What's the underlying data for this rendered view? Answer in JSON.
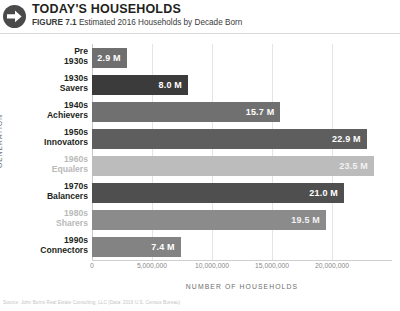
{
  "header": {
    "icon": "arrow-right-circle-icon",
    "title": "TODAY'S HOUSEHOLDS",
    "figure_label": "FIGURE 7.1",
    "subtitle": "Estimated 2016 Households by Decade Born"
  },
  "footer": {
    "source": "Source: John Burns Real Estate Consulting, LLC (Data: 2016 U.S. Census Bureau)"
  },
  "chart_data": {
    "type": "bar",
    "orientation": "horizontal",
    "title": "Estimated 2016 Households by Decade Born",
    "xlabel": "NUMBER OF HOUSEHOLDS",
    "ylabel": "GENERATION",
    "xlim": [
      0,
      25000000
    ],
    "grid": true,
    "legend": "none",
    "xticks": [
      "0",
      "5,000,000",
      "10,000,000",
      "15,000,000",
      "20,000,000"
    ],
    "xtick_values": [
      0,
      5000000,
      10000000,
      15000000,
      20000000
    ],
    "categories": [
      "Pre 1930s",
      "1930s Savers",
      "1940s Achievers",
      "1950s Innovators",
      "1960s Equalers",
      "1970s Balancers",
      "1980s Sharers",
      "1990s Connectors"
    ],
    "values": [
      2900000,
      8000000,
      15700000,
      22900000,
      23500000,
      21000000,
      19500000,
      7400000
    ],
    "bars": [
      {
        "decade": "Pre",
        "generation": "1930s",
        "label": "2.9 M",
        "value": 2900000,
        "color": "#6f6f6f",
        "muted": false
      },
      {
        "decade": "1930s",
        "generation": "Savers",
        "label": "8.0 M",
        "value": 8000000,
        "color": "#3b3b3b",
        "muted": false
      },
      {
        "decade": "1940s",
        "generation": "Achievers",
        "label": "15.7 M",
        "value": 15700000,
        "color": "#707070",
        "muted": false
      },
      {
        "decade": "1950s",
        "generation": "Innovators",
        "label": "22.9 M",
        "value": 22900000,
        "color": "#5e5e5e",
        "muted": false
      },
      {
        "decade": "1960s",
        "generation": "Equalers",
        "label": "23.5 M",
        "value": 23500000,
        "color": "#bcbcbc",
        "muted": true
      },
      {
        "decade": "1970s",
        "generation": "Balancers",
        "label": "21.0 M",
        "value": 21000000,
        "color": "#4f4f4f",
        "muted": false
      },
      {
        "decade": "1980s",
        "generation": "Sharers",
        "label": "19.5 M",
        "value": 19500000,
        "color": "#8b8b8b",
        "muted": true
      },
      {
        "decade": "1990s",
        "generation": "Connectors",
        "label": "7.4 M",
        "value": 7400000,
        "color": "#838383",
        "muted": false
      }
    ]
  },
  "colors": {
    "background": "#ffffff",
    "text": "#231f20",
    "grid": "#e4e4e4",
    "axis_label": "#6d6d6d",
    "muted_label": "#b9b9b9"
  }
}
